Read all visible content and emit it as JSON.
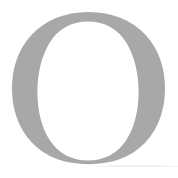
{
  "canvas": {
    "width": 178,
    "height": 178,
    "background_color": "#FFFFFF"
  },
  "glyph": {
    "character": "O",
    "name": "capital-letter-o",
    "description": "Large gray serif capital letter O",
    "fill_color": "#A8A8A8",
    "counter_color": "#FFFFFF",
    "style": "serif",
    "weight": "regular",
    "bounds": {
      "left": 12,
      "top": 12,
      "right": 165,
      "bottom": 164,
      "width": 153,
      "height": 152
    },
    "stroke": {
      "side_thickness": 26,
      "top_thickness": 9,
      "bottom_thickness": 11
    },
    "counter": {
      "center_x": 88,
      "center_y": 88,
      "radius_x": 50,
      "radius_y": 63
    }
  },
  "artifacts": {
    "scan_line_color": "#F0F0F0",
    "scan_line_label": "faint-horizontal-scan-line"
  }
}
